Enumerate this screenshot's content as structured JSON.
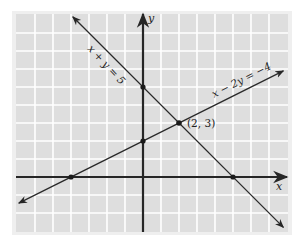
{
  "chart_data": {
    "type": "line",
    "title": "",
    "xlabel": "x",
    "ylabel": "y",
    "xlim": [
      -7,
      8
    ],
    "ylim": [
      -3,
      9
    ],
    "grid": true,
    "series": [
      {
        "name": "x + y = 5",
        "label": "x + y = 5",
        "points": [
          [
            -3.9,
            8.9
          ],
          [
            7.8,
            -2.8
          ]
        ],
        "marked_points": [
          [
            0,
            5
          ],
          [
            5,
            0
          ]
        ]
      },
      {
        "name": "x − 2y = −4",
        "label": "x − 2y = −4",
        "points": [
          [
            -6.9,
            -1.45
          ],
          [
            7.8,
            5.9
          ]
        ],
        "marked_points": [
          [
            -4,
            0
          ],
          [
            0,
            2
          ]
        ]
      }
    ],
    "intersection": {
      "point": [
        2,
        3
      ],
      "label": "(2, 3)"
    },
    "annotations": [
      "x + y = 5",
      "x − 2y = −4",
      "(2, 3)"
    ]
  },
  "colors": {
    "grid_fill": "#dedede",
    "grid_line": "#ffffff",
    "frame": "#eeeeee",
    "ink": "#262626"
  }
}
